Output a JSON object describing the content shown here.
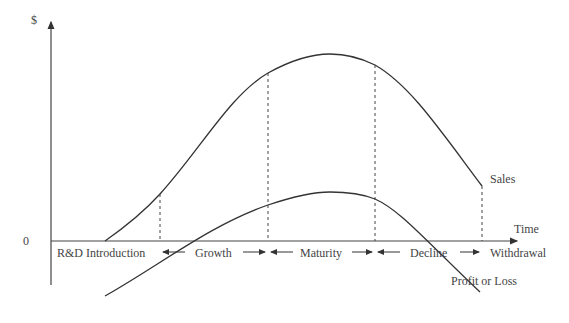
{
  "diagram": {
    "y_axis_label": "$",
    "x_axis_label": "Time",
    "origin_label": "0",
    "curves": [
      {
        "name": "Sales",
        "label": "Sales"
      },
      {
        "name": "Profit or Loss",
        "label": "Profit or Loss"
      }
    ],
    "stages": [
      {
        "label": "R&D Introduction"
      },
      {
        "label": "Growth"
      },
      {
        "label": "Maturity"
      },
      {
        "label": "Decline"
      },
      {
        "label": "Withdrawal"
      }
    ]
  }
}
